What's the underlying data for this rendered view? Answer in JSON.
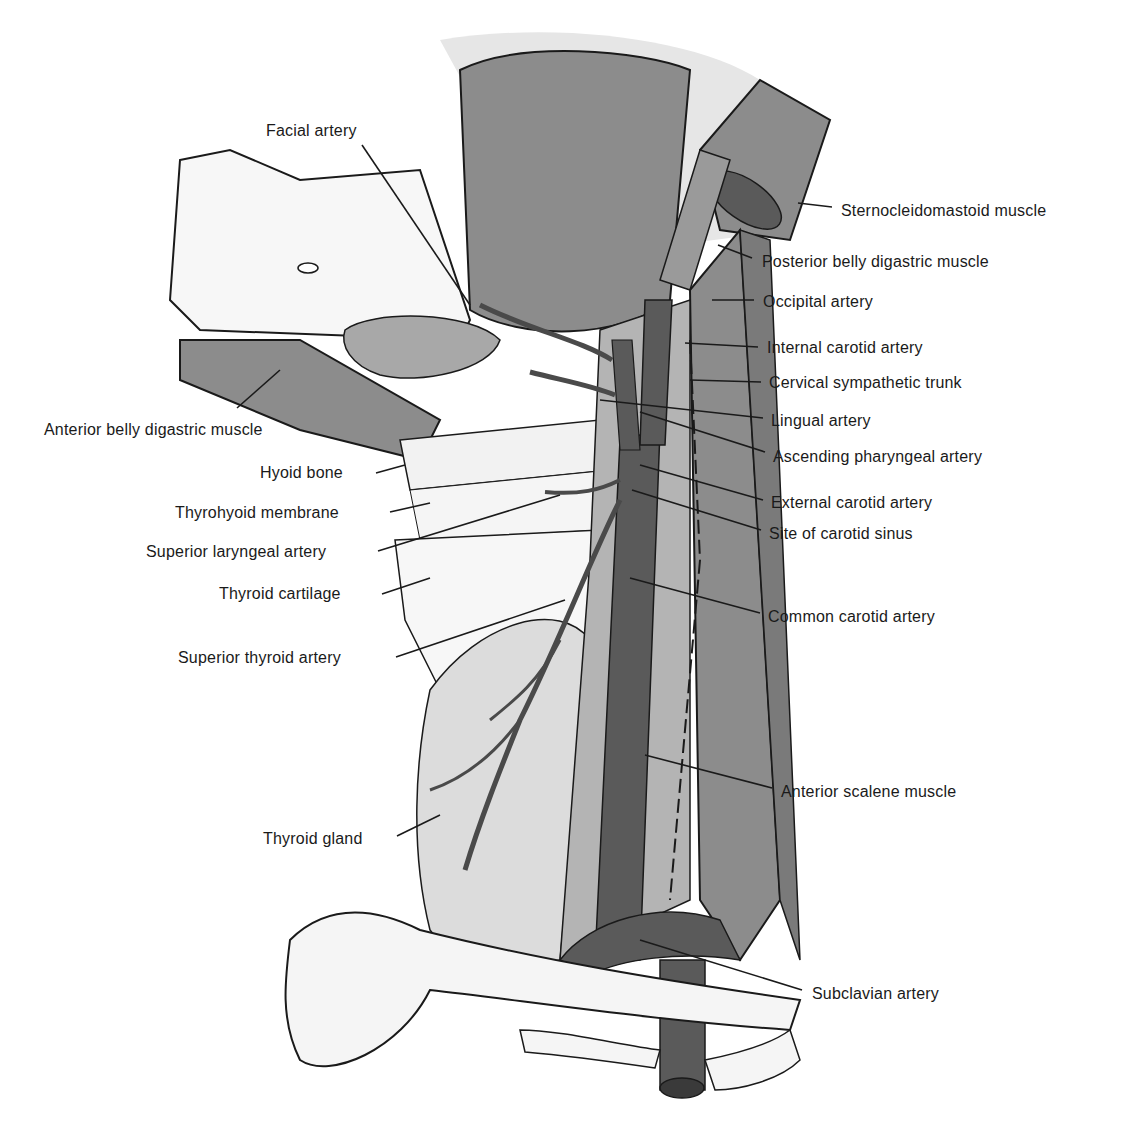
{
  "figure": {
    "labels": [
      {
        "id": "facial-artery",
        "text": "Facial artery",
        "x": 266,
        "y": 122,
        "align": "left",
        "leader": [
          [
            362,
            145
          ],
          [
            470,
            305
          ]
        ]
      },
      {
        "id": "sternocleidomastoid-muscle",
        "text": "Sternocleidomastoid muscle",
        "x": 841,
        "y": 202,
        "align": "left",
        "leader": [
          [
            798,
            203
          ],
          [
            832,
            207
          ]
        ]
      },
      {
        "id": "posterior-belly-digastric-muscle",
        "text": "Posterior belly digastric muscle",
        "x": 762,
        "y": 253,
        "align": "left",
        "leader": [
          [
            718,
            245
          ],
          [
            752,
            258
          ]
        ]
      },
      {
        "id": "occipital-artery",
        "text": "Occipital artery",
        "x": 763,
        "y": 293,
        "align": "left",
        "leader": [
          [
            712,
            300
          ],
          [
            754,
            300
          ]
        ]
      },
      {
        "id": "internal-carotid-artery",
        "text": "Internal carotid artery",
        "x": 767,
        "y": 339,
        "align": "left",
        "leader": [
          [
            685,
            343
          ],
          [
            758,
            347
          ]
        ]
      },
      {
        "id": "cervical-sympathetic-trunk",
        "text": "Cervical sympathetic trunk",
        "x": 769,
        "y": 374,
        "align": "left",
        "leader": [
          [
            690,
            380
          ],
          [
            761,
            382
          ]
        ]
      },
      {
        "id": "lingual-artery",
        "text": "Lingual artery",
        "x": 771,
        "y": 412,
        "align": "left",
        "leader": [
          [
            600,
            400
          ],
          [
            763,
            418
          ]
        ]
      },
      {
        "id": "ascending-pharyngeal-artery",
        "text": "Ascending pharyngeal artery",
        "x": 773,
        "y": 448,
        "align": "left",
        "leader": [
          [
            640,
            412
          ],
          [
            765,
            452
          ]
        ]
      },
      {
        "id": "external-carotid-artery",
        "text": "External carotid artery",
        "x": 771,
        "y": 494,
        "align": "left",
        "leader": [
          [
            640,
            465
          ],
          [
            763,
            500
          ]
        ]
      },
      {
        "id": "site-of-carotid-sinus",
        "text": "Site of carotid sinus",
        "x": 769,
        "y": 525,
        "align": "left",
        "leader": [
          [
            632,
            490
          ],
          [
            761,
            530
          ]
        ]
      },
      {
        "id": "common-carotid-artery",
        "text": "Common carotid artery",
        "x": 768,
        "y": 608,
        "align": "left",
        "leader": [
          [
            630,
            578
          ],
          [
            760,
            613
          ]
        ]
      },
      {
        "id": "anterior-scalene-muscle",
        "text": "Anterior scalene muscle",
        "x": 781,
        "y": 783,
        "align": "left",
        "leader": [
          [
            645,
            755
          ],
          [
            772,
            788
          ]
        ]
      },
      {
        "id": "subclavian-artery",
        "text": "Subclavian artery",
        "x": 812,
        "y": 985,
        "align": "left",
        "leader": [
          [
            640,
            940
          ],
          [
            802,
            990
          ]
        ]
      },
      {
        "id": "anterior-belly-digastric-muscle",
        "text": "Anterior belly digastric muscle",
        "x": 44,
        "y": 421,
        "align": "left",
        "leader": [
          [
            237,
            408
          ],
          [
            280,
            370
          ]
        ]
      },
      {
        "id": "hyoid-bone",
        "text": "Hyoid bone",
        "x": 260,
        "y": 464,
        "align": "left",
        "leader": [
          [
            376,
            473
          ],
          [
            405,
            465
          ]
        ]
      },
      {
        "id": "thyrohyoid-membrane",
        "text": "Thyrohyoid membrane",
        "x": 175,
        "y": 504,
        "align": "left",
        "leader": [
          [
            390,
            512
          ],
          [
            430,
            503
          ]
        ]
      },
      {
        "id": "superior-laryngeal-artery",
        "text": "Superior laryngeal artery",
        "x": 146,
        "y": 543,
        "align": "left",
        "leader": [
          [
            378,
            551
          ],
          [
            560,
            495
          ]
        ]
      },
      {
        "id": "thyroid-cartilage",
        "text": "Thyroid cartilage",
        "x": 219,
        "y": 585,
        "align": "left",
        "leader": [
          [
            382,
            594
          ],
          [
            430,
            578
          ]
        ]
      },
      {
        "id": "superior-thyroid-artery",
        "text": "Superior thyroid artery",
        "x": 178,
        "y": 649,
        "align": "left",
        "leader": [
          [
            396,
            657
          ],
          [
            565,
            600
          ]
        ]
      },
      {
        "id": "thyroid-gland",
        "text": "Thyroid gland",
        "x": 263,
        "y": 830,
        "align": "left",
        "leader": [
          [
            397,
            836
          ],
          [
            440,
            815
          ]
        ]
      }
    ],
    "colors": {
      "background": "#ffffff",
      "muscle": "#8c8c8c",
      "muscle_dark": "#6e6e6e",
      "artery": "#5a5a5a",
      "bone": "#f2f2f2",
      "gland": "#d9d9d9",
      "ink": "#1a1a1a"
    }
  }
}
